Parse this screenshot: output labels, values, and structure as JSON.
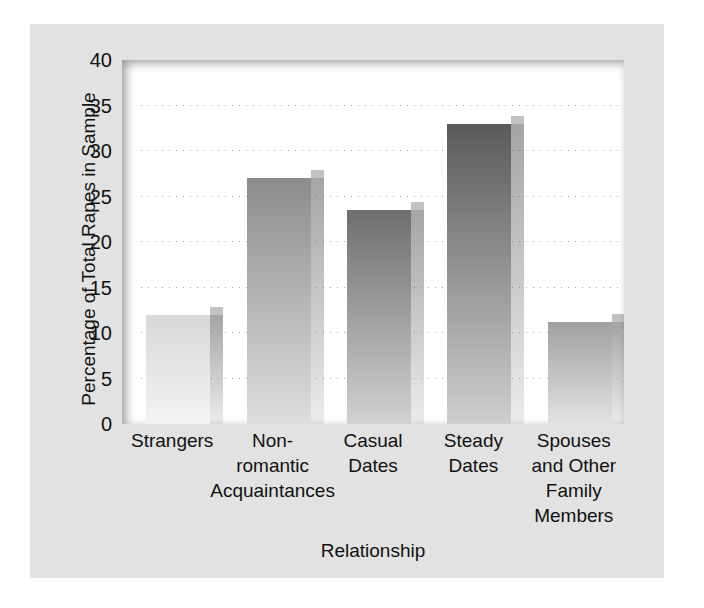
{
  "chart_data": {
    "type": "bar",
    "title": "",
    "xlabel": "Relationship",
    "ylabel": "Percentage of Total Rapes in Sample",
    "categories": [
      "Strangers",
      "Non-romantic Acquaintances",
      "Casual Dates",
      "Steady Dates",
      "Spouses and Other Family Members"
    ],
    "category_lines": [
      [
        "Strangers"
      ],
      [
        "Non-",
        "romantic",
        "Acquaintances"
      ],
      [
        "Casual",
        "Dates"
      ],
      [
        "Steady",
        "Dates"
      ],
      [
        "Spouses",
        "and Other",
        "Family",
        "Members"
      ]
    ],
    "values": [
      12.0,
      27.0,
      23.5,
      33.0,
      11.2
    ],
    "ylim": [
      0,
      40
    ],
    "yticks": [
      0,
      5,
      10,
      15,
      20,
      25,
      30,
      35,
      40
    ],
    "ytick_labels": [
      "0",
      "5",
      "10",
      "15",
      "20",
      "25",
      "30",
      "35",
      "40"
    ],
    "grid": "horizontal-dotted",
    "legend": "none",
    "bar_colors_top": [
      "#d8d8d8",
      "#8c8c8c",
      "#6e6e6e",
      "#5a5a5a",
      "#a0a0a0"
    ],
    "bar_colors_bottom": [
      "#f3f3f3",
      "#dedede",
      "#d2d2d2",
      "#cfcfcf",
      "#e3e3e3"
    ],
    "background_color": "#e2e2e2",
    "plot_background_color": "#ffffff"
  }
}
